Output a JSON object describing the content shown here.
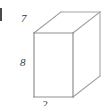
{
  "figure": {
    "shape_name": "rectangular-prism",
    "background_color": "#ffffff",
    "line_color": "#9a9a9a",
    "line_color_dark": "#7d7d7d",
    "label_color": "#3a3a3a",
    "labels": {
      "depth": "7",
      "height": "8",
      "width": "2"
    },
    "label_positions": {
      "depth": "top-left, beside upper receding edge",
      "height": "left, beside front vertical edge",
      "width": "bottom-center, beside front bottom edge (clipped by image edge)"
    },
    "artifact": {
      "left_edge_stub": "clipped mark at far left border"
    }
  },
  "geometry": {
    "front_face": {
      "top_left": [
        34,
        33
      ],
      "top_right": [
        73,
        33
      ],
      "bottom_right": [
        73,
        97
      ],
      "bottom_left": [
        34,
        97
      ]
    },
    "back_offset": [
      27,
      -21
    ],
    "back_face": {
      "top_left": [
        61,
        12
      ],
      "top_right": [
        100,
        12
      ],
      "bottom_right": [
        100,
        76
      ],
      "bottom_left": [
        61,
        76
      ]
    },
    "visible_edges": [
      "front-top",
      "front-right",
      "front-bottom",
      "front-left",
      "receding-top-left",
      "receding-top-right",
      "receding-bottom-right",
      "back-top",
      "back-right"
    ]
  }
}
